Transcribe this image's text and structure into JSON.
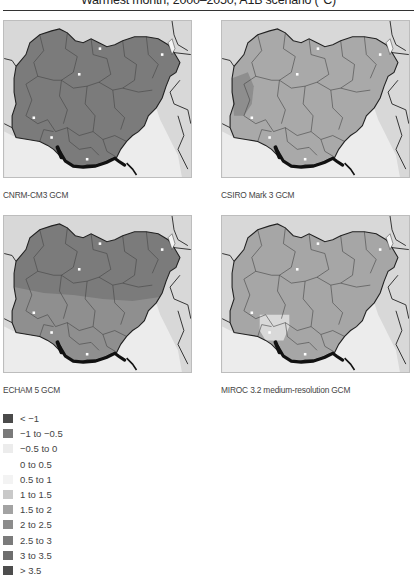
{
  "title": "Warmest month, 2000–2050, A1B scenario (°C)",
  "colors": {
    "sea": "#ececec",
    "land_outside": "#d8d8d8",
    "border": "#222222",
    "coast_dark": "#111111"
  },
  "panels": [
    {
      "id": "cnrm",
      "caption": "CNRM-CM3 GCM",
      "fill": "#7b7b7b",
      "fill_south": "#7b7b7b",
      "patch": null
    },
    {
      "id": "csiro",
      "caption": "CSIRO Mark 3 GCM",
      "fill": "#a9a9a9",
      "fill_south": "#a9a9a9",
      "west_patch": "#8e8e8e"
    },
    {
      "id": "echam",
      "caption": "ECHAM 5 GCM",
      "fill": "#7b7b7b",
      "fill_south": "#8f8f8f"
    },
    {
      "id": "miroc",
      "caption": "MIROC 3.2 medium-resolution GCM",
      "fill": "#a6a6a6",
      "fill_south": "#a6a6a6",
      "light_patch": "#d9d9d9"
    }
  ],
  "legend": [
    {
      "label": "< −1",
      "color": "#4a4a4a"
    },
    {
      "label": "−1 to −0.5",
      "color": "#7a7a7a"
    },
    {
      "label": "−0.5 to 0",
      "color": "#ececec"
    },
    {
      "label": "0 to 0.5",
      "color": "#ffffff"
    },
    {
      "label": "0.5 to 1",
      "color": "#f3f3f3"
    },
    {
      "label": "1 to 1.5",
      "color": "#c9c9c9"
    },
    {
      "label": "1.5 to 2",
      "color": "#a3a3a3"
    },
    {
      "label": "2 to 2.5",
      "color": "#8c8c8c"
    },
    {
      "label": "2.5 to 3",
      "color": "#7b7b7b"
    },
    {
      "label": "3 to 3.5",
      "color": "#6e6e6e"
    },
    {
      "label": "> 3.5",
      "color": "#4d4d4d"
    }
  ]
}
